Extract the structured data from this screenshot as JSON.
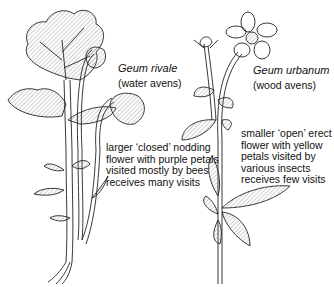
{
  "figure": {
    "plants": [
      {
        "species": "Geum rivale",
        "common_name": "(water avens)",
        "description": [
          "larger ‘closed’ nodding",
          "flower with purple petals",
          "visited mostly by bees",
          "receives many visits"
        ]
      },
      {
        "species": "Geum urbanum",
        "common_name": "(wood avens)",
        "description": [
          "smaller ‘open’ erect",
          "flower with yellow",
          "petals visited by",
          "various insects",
          "receives few visits"
        ]
      }
    ],
    "colors": {
      "ink": "#222222",
      "hatch": "#9a9a9a",
      "background": "#ffffff"
    }
  }
}
